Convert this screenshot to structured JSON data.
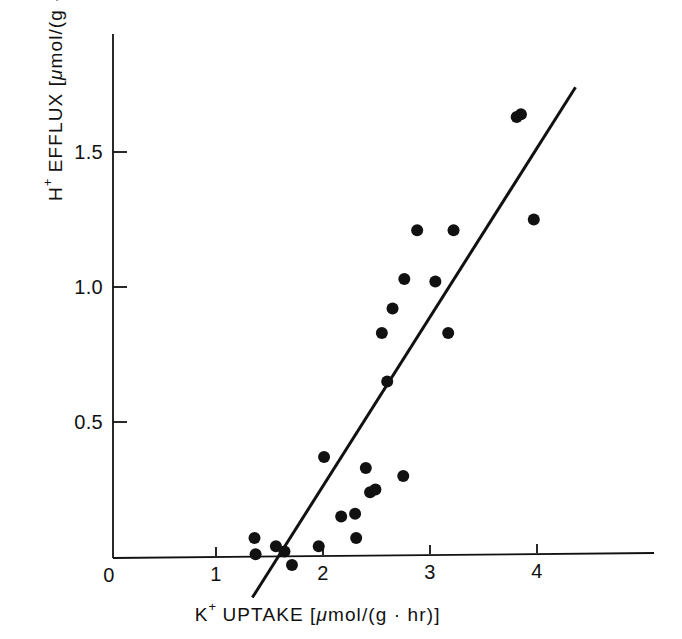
{
  "figure": {
    "background_color": "#ffffff",
    "ink_color": "#111111",
    "width": 682,
    "height": 639
  },
  "axes": {
    "x": {
      "title_parts": {
        "symbol": "K",
        "charge": "+",
        "word": " UPTAKE ",
        "unit_open": "[",
        "unit_mu": "μ",
        "unit_rest": "mol/(g · hr)",
        "unit_close": "]"
      },
      "title_full": "K+ UPTAKE [μmol/(g · hr)]",
      "tick_labels": [
        "0",
        "1",
        "2",
        "3",
        "4"
      ],
      "tick_values": [
        0,
        1,
        2,
        3,
        4
      ],
      "range": [
        0,
        5.1
      ]
    },
    "y": {
      "title_parts": {
        "symbol": "H",
        "charge": "+",
        "word": " EFFLUX ",
        "unit_open": "[",
        "unit_mu": "μ",
        "unit_rest": "mol/(g · hr)",
        "unit_close": "]"
      },
      "title_full": "H+ EFFLUX [μmol/(g · hr)]",
      "tick_labels": [
        "0.5",
        "1.0",
        "1.5"
      ],
      "tick_values": [
        0.5,
        1.0,
        1.5
      ],
      "range": [
        -0.12,
        1.92
      ]
    }
  },
  "chart_data": {
    "type": "scatter",
    "title": "",
    "xlabel": "K+ UPTAKE [μmol/(g · hr)]",
    "ylabel": "H+ EFFLUX [μmol/(g · hr)]",
    "xlim": [
      0,
      5.1
    ],
    "ylim": [
      -0.12,
      1.92
    ],
    "xticks": [
      0,
      1,
      2,
      3,
      4
    ],
    "yticks": [
      0.5,
      1.0,
      1.5
    ],
    "grid": false,
    "legend": null,
    "marker": {
      "shape": "filled-circle",
      "color": "#111111",
      "radius_px": 6
    },
    "points": [
      {
        "x": 1.36,
        "y": 0.07
      },
      {
        "x": 1.37,
        "y": 0.01
      },
      {
        "x": 1.56,
        "y": 0.04
      },
      {
        "x": 1.64,
        "y": 0.02
      },
      {
        "x": 1.71,
        "y": -0.03
      },
      {
        "x": 1.96,
        "y": 0.04
      },
      {
        "x": 2.01,
        "y": 0.37
      },
      {
        "x": 2.17,
        "y": 0.15
      },
      {
        "x": 2.3,
        "y": 0.16
      },
      {
        "x": 2.31,
        "y": 0.07
      },
      {
        "x": 2.4,
        "y": 0.33
      },
      {
        "x": 2.44,
        "y": 0.24
      },
      {
        "x": 2.49,
        "y": 0.25
      },
      {
        "x": 2.55,
        "y": 0.83
      },
      {
        "x": 2.6,
        "y": 0.65
      },
      {
        "x": 2.65,
        "y": 0.92
      },
      {
        "x": 2.75,
        "y": 0.3
      },
      {
        "x": 2.76,
        "y": 1.03
      },
      {
        "x": 2.88,
        "y": 1.21
      },
      {
        "x": 3.05,
        "y": 1.02
      },
      {
        "x": 3.17,
        "y": 0.83
      },
      {
        "x": 3.22,
        "y": 1.21
      },
      {
        "x": 3.81,
        "y": 1.63
      },
      {
        "x": 3.85,
        "y": 1.64
      },
      {
        "x": 3.97,
        "y": 1.25
      }
    ],
    "fit_line": {
      "label": "regression line",
      "x_start": 1.34,
      "y_start": -0.15,
      "x_end": 4.36,
      "y_end": 1.74,
      "slope": 0.626,
      "intercept": -0.989,
      "color": "#111111",
      "width_px": 3
    }
  },
  "geometry": {
    "x0_px": 109,
    "y0_px": 557,
    "px_per_x_unit": 107,
    "px_per_y_unit": 270,
    "x_axis_left_px": 113,
    "x_axis_right_px": 654,
    "y_axis_top_px": 34,
    "tick_len_px": 9
  }
}
